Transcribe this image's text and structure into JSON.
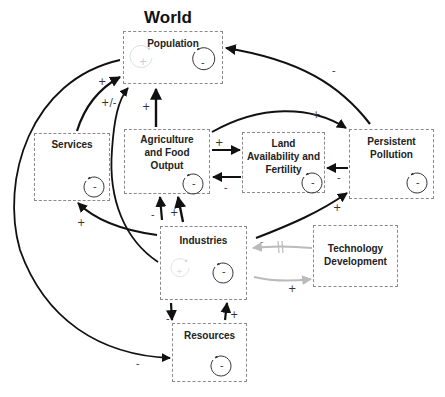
{
  "title": "World",
  "nodes": {
    "population": {
      "label": "Population"
    },
    "services": {
      "label": "Services"
    },
    "agriculture": {
      "label": "Agriculture and Food Output"
    },
    "land": {
      "label": "Land Availability and Fertility"
    },
    "pollution": {
      "label": "Persistent Pollution"
    },
    "industries": {
      "label": "Industries"
    },
    "technology": {
      "label": "Technology Development"
    },
    "resources": {
      "label": "Resources"
    }
  },
  "loops": {
    "balancing_sign": "-",
    "reinforcing_sign": "+"
  },
  "links": [
    {
      "from": "Persistent Pollution",
      "to": "Population",
      "polarity": "-"
    },
    {
      "from": "Services",
      "to": "Population",
      "polarity": "+"
    },
    {
      "from": "Industries",
      "to": "Population",
      "polarity": "+/-"
    },
    {
      "from": "Agriculture and Food Output",
      "to": "Population",
      "polarity": "+"
    },
    {
      "from": "Agriculture and Food Output",
      "to": "Persistent Pollution",
      "polarity": "+"
    },
    {
      "from": "Agriculture and Food Output",
      "to": "Land Availability and Fertility",
      "polarity": "+"
    },
    {
      "from": "Land Availability and Fertility",
      "to": "Agriculture and Food Output",
      "polarity": "-"
    },
    {
      "from": "Persistent Pollution",
      "to": "Land Availability and Fertility",
      "polarity": "-"
    },
    {
      "from": "Industries",
      "to": "Persistent Pollution",
      "polarity": "+"
    },
    {
      "from": "Industries",
      "to": "Agriculture and Food Output",
      "polarity": "-"
    },
    {
      "from": "Industries",
      "to": "Agriculture and Food Output",
      "polarity": "+"
    },
    {
      "from": "Industries",
      "to": "Services",
      "polarity": "+"
    },
    {
      "from": "Technology Development",
      "to": "Industries",
      "polarity": "-",
      "delayed": true
    },
    {
      "from": "Industries",
      "to": "Technology Development",
      "polarity": "+"
    },
    {
      "from": "Industries",
      "to": "Resources",
      "polarity": "-"
    },
    {
      "from": "Resources",
      "to": "Industries",
      "polarity": "+"
    },
    {
      "from": "Population",
      "to": "Resources",
      "polarity": "-"
    }
  ],
  "polarity_labels": {
    "pollution_population": "-",
    "services_population": "+",
    "industries_population": "+/-",
    "agri_population": "+",
    "agri_pollution": "+",
    "agri_land": "+",
    "land_agri": "-",
    "pollution_land": "-",
    "industries_pollution": "+",
    "industries_agri_minus": "-",
    "industries_agri_plus": "+",
    "industries_services": "+",
    "tech_industries": "-",
    "industries_tech": "+",
    "industries_resources": "-",
    "resources_industries": "+",
    "population_resources": "-"
  }
}
